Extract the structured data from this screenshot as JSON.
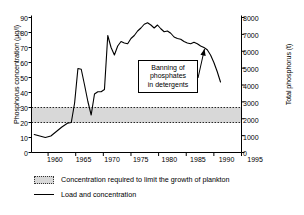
{
  "chart_data": {
    "type": "line",
    "title": "",
    "xlabel": "",
    "ylabel": "Phosphorus concentration (µg/l)",
    "y2label": "Total phosphorus (t)",
    "xlim": [
      1957,
      1995
    ],
    "ylim": [
      0,
      90
    ],
    "y2lim": [
      0,
      8000
    ],
    "grid": false,
    "legend_position": "bottom-left",
    "x_ticks": [
      "1960",
      "1965",
      "1970",
      "1975",
      "1980",
      "1985",
      "1990",
      "1995"
    ],
    "x_tick_values": [
      1960,
      1965,
      1970,
      1975,
      1980,
      1985,
      1990,
      1995
    ],
    "y_ticks": [
      "0",
      "10",
      "20",
      "30",
      "40",
      "50",
      "60",
      "70",
      "80",
      "90"
    ],
    "y_tick_values": [
      0,
      10,
      20,
      30,
      40,
      50,
      60,
      70,
      80,
      90
    ],
    "y2_ticks": [
      "0",
      "1000",
      "2000",
      "3000",
      "4000",
      "5000",
      "6000",
      "7000",
      "8000"
    ],
    "y2_tick_values": [
      0,
      1000,
      2000,
      3000,
      4000,
      5000,
      6000,
      7000,
      8000
    ],
    "series": [
      {
        "name": "Load and concentration",
        "color": "#000000",
        "x": [
          1957.5,
          1958.5,
          1959.5,
          1960.5,
          1961.5,
          1962.5,
          1963.5,
          1964.2,
          1964.8,
          1965.4,
          1966.0,
          1966.6,
          1967.2,
          1967.8,
          1968.4,
          1969.0,
          1969.6,
          1970.2,
          1970.8,
          1971.4,
          1972.0,
          1972.6,
          1973.2,
          1973.8,
          1974.4,
          1975.0,
          1975.6,
          1976.2,
          1976.8,
          1977.4,
          1978.0,
          1978.6,
          1979.2,
          1979.8,
          1980.4,
          1981.0,
          1981.6,
          1982.2,
          1982.8,
          1983.4,
          1984.0,
          1984.6,
          1985.2,
          1985.8,
          1986.4,
          1987.0,
          1987.6,
          1988.2,
          1988.8,
          1989.4,
          1990.0,
          1990.6,
          1991.2
        ],
        "y": [
          12,
          11,
          10,
          11,
          14,
          17,
          19.5,
          20,
          33,
          56,
          55.5,
          45,
          34,
          25,
          39,
          40.5,
          40.5,
          42,
          78,
          70,
          65,
          71,
          74,
          73,
          72.5,
          76,
          78,
          81,
          83,
          85.5,
          86.5,
          85,
          83,
          85,
          82.5,
          80.5,
          81,
          79.5,
          77,
          76,
          75.5,
          74,
          73,
          72.5,
          73.5,
          72.5,
          71,
          70,
          68.5,
          65,
          60,
          54,
          47
        ]
      }
    ],
    "bands": [
      {
        "name": "Concentration required to limit the growth of plankton",
        "y_lower": 20,
        "y_upper": 30,
        "fill": "#d8d8d8",
        "border_style": "dotted"
      }
    ],
    "annotations": [
      {
        "name": "banning-of-phosphates",
        "lines": [
          "Banning of",
          "phosphates",
          "in detergents"
        ],
        "arrow_to_x": 1988.3,
        "arrow_to_y": 69
      }
    ],
    "legend_items": [
      {
        "label": "Concentration required to limit the growth of plankton",
        "marker": "band"
      },
      {
        "label": "Load and concentration",
        "marker": "line"
      }
    ]
  }
}
